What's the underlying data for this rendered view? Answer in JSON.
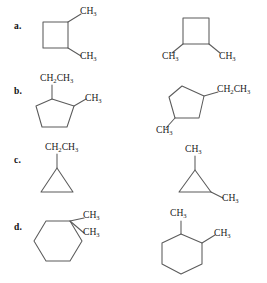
{
  "page": {
    "background_color": "#ffffff",
    "bond_color": "#5b5b5b",
    "text_color": "#1c1c1c"
  },
  "rows": [
    {
      "label": "a.",
      "left": {
        "ring": "cyclobutane",
        "ring_sides": 4,
        "substituents": [
          {
            "text_base": "CH",
            "text_sub": "3",
            "position": "top-right-vertex"
          },
          {
            "text_base": "CH",
            "text_sub": "3",
            "position": "bottom-right-vertex"
          }
        ]
      },
      "right": {
        "ring": "cyclobutane",
        "ring_sides": 4,
        "substituents": [
          {
            "text_base": "CH",
            "text_sub": "3",
            "position": "bottom-left-vertex"
          },
          {
            "text_base": "CH",
            "text_sub": "3",
            "position": "bottom-right-vertex"
          }
        ]
      }
    },
    {
      "label": "b.",
      "left": {
        "ring": "cyclopentane",
        "ring_sides": 5,
        "substituents": [
          {
            "text_base": "CH",
            "text_sub": "2",
            "text_base2": "CH",
            "text_sub2": "3",
            "position": "top-left-vertex"
          },
          {
            "text_base": "CH",
            "text_sub": "3",
            "position": "top-right-vertex"
          }
        ]
      },
      "right": {
        "ring": "cyclopentane",
        "ring_sides": 5,
        "substituents": [
          {
            "text_base": "CH",
            "text_sub": "2",
            "text_base2": "CH",
            "text_sub2": "3",
            "position": "right-vertex"
          },
          {
            "text_base": "CH",
            "text_sub": "3",
            "position": "lower-left-vertex"
          }
        ]
      }
    },
    {
      "label": "c.",
      "left": {
        "ring": "cyclopropane",
        "ring_sides": 3,
        "substituents": [
          {
            "text_base": "CH",
            "text_sub": "2",
            "text_base2": "CH",
            "text_sub2": "3",
            "position": "apex"
          }
        ]
      },
      "right": {
        "ring": "cyclopropane",
        "ring_sides": 3,
        "substituents": [
          {
            "text_base": "CH",
            "text_sub": "3",
            "position": "apex"
          },
          {
            "text_base": "CH",
            "text_sub": "3",
            "position": "bottom-right-vertex"
          }
        ]
      }
    },
    {
      "label": "d.",
      "left": {
        "ring": "cyclohexane",
        "ring_sides": 6,
        "substituents": [
          {
            "text_base": "CH",
            "text_sub": "3",
            "position": "upper-right-vertex-a"
          },
          {
            "text_base": "CH",
            "text_sub": "3",
            "position": "upper-right-vertex-b"
          }
        ]
      },
      "right": {
        "ring": "cyclohexane",
        "ring_sides": 6,
        "substituents": [
          {
            "text_base": "CH",
            "text_sub": "3",
            "position": "top-vertex"
          },
          {
            "text_base": "CH",
            "text_sub": "3",
            "position": "upper-right-vertex"
          }
        ]
      }
    }
  ]
}
